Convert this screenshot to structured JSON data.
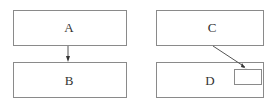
{
  "diagram": {
    "left_panel": {
      "top_box": {
        "label": "A"
      },
      "bottom_box": {
        "label": "B"
      },
      "arrow": {
        "from": "A",
        "to": "B"
      }
    },
    "right_panel": {
      "top_box": {
        "label": "C"
      },
      "bottom_box": {
        "label": "D",
        "inner_box": {
          "label": ""
        }
      },
      "arrow": {
        "from": "C",
        "to": "D inner box"
      }
    },
    "colors": {
      "stroke": "#8a8a8a",
      "text": "#333333",
      "background": "#ffffff"
    }
  }
}
